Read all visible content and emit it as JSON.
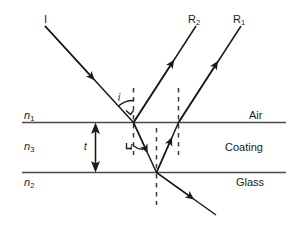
{
  "figure": {
    "colors": {
      "ray": "#1a1a1a",
      "interface": "#4a4a4a",
      "dashed_normal": "#3a3a3a",
      "text": "#1a1a1a",
      "background": "#ffffff"
    },
    "rays": [
      {
        "name": "incident-ray",
        "label": "I",
        "label_x": 44,
        "label_y": 14
      },
      {
        "name": "reflected-ray-2",
        "label": "R",
        "sub": "2",
        "label_x": 188,
        "label_y": 14
      },
      {
        "name": "reflected-ray-1",
        "label": "R",
        "sub": "1",
        "label_x": 233,
        "label_y": 14
      }
    ],
    "media": [
      {
        "name": "air-layer",
        "index_label": "n",
        "index_sub": "1",
        "material": "Air"
      },
      {
        "name": "coating-layer",
        "index_label": "n",
        "index_sub": "3",
        "material": "Coating"
      },
      {
        "name": "glass-layer",
        "index_label": "n",
        "index_sub": "2",
        "material": "Glass"
      }
    ],
    "angles": [
      {
        "name": "angle-of-incidence",
        "label": "i"
      },
      {
        "name": "angle-of-refraction",
        "label": "r"
      }
    ],
    "thickness": {
      "name": "coating-thickness",
      "label": "t"
    }
  }
}
